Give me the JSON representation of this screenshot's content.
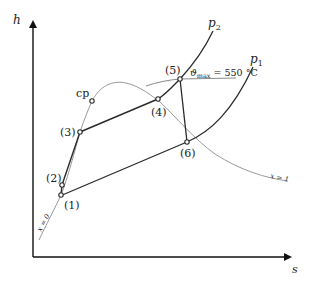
{
  "diagram": {
    "type": "h-s diagram (Mollier) of steam power cycle with reheat",
    "axes": {
      "y_label": "h",
      "x_label": "s"
    },
    "critical_point": {
      "label": "cp"
    },
    "states": [
      {
        "id": "1",
        "label": "(1)"
      },
      {
        "id": "2",
        "label": "(2)"
      },
      {
        "id": "3",
        "label": "(3)"
      },
      {
        "id": "4",
        "label": "(4)"
      },
      {
        "id": "5",
        "label": "(5)"
      },
      {
        "id": "6",
        "label": "(6)"
      }
    ],
    "isobars": {
      "high": {
        "label": "p",
        "sub": "2"
      },
      "low": {
        "label": "p",
        "sub": "1"
      }
    },
    "isotherm": {
      "symbol": "ϑ",
      "sub": "max",
      "value_text": " = 550 °C"
    },
    "quality_lines": {
      "sat_liquid": "x = 0",
      "sat_vapor": "x = 1"
    },
    "colors": {
      "cycle_line": "#2a2a2a",
      "saturation_curve": "#9a9a9a",
      "isotherm_line": "#8a8a8a",
      "axis": "#111111"
    }
  }
}
